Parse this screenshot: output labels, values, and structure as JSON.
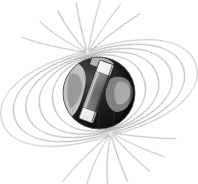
{
  "figure": {
    "title": "Earth's magnetic dipole field with internal bar magnet",
    "background_color": "#ffffff",
    "width": 198,
    "height": 184
  },
  "colors": {
    "background": "#ffffff",
    "field_line": "#9a9a9a",
    "field_line_faint": "#c2c2c2",
    "globe_dark": "#111111",
    "globe_mid": "#3a3a3a",
    "globe_land_light": "#d9d9d9",
    "globe_land_mid": "#8e8e8e",
    "globe_edge": "#555555",
    "magnet_light_pole": "#f2f2f2",
    "magnet_body": "#6e6e6e",
    "magnet_dark": "#2a2a2a",
    "magnet_outline": "#1a1a1a"
  },
  "globe": {
    "label": "earth-sphere",
    "center_x": 99,
    "center_y": 93,
    "radius": 36,
    "tilt_degrees": -18
  },
  "magnet": {
    "label": "bar-magnet",
    "center_x": 97,
    "center_y": 93,
    "length": 62,
    "width": 15,
    "rotation_degrees": 20,
    "north_end": "top-right",
    "south_end": "bottom-left"
  },
  "field": {
    "label": "magnetic-field-lines",
    "line_count": 26,
    "axis_tilt_degrees": -16,
    "north_pole_x": 101,
    "north_pole_y": 60,
    "south_pole_x": 96,
    "south_pole_y": 127,
    "loops": [
      {
        "side": "left",
        "extent": 14
      },
      {
        "side": "left",
        "extent": 26
      },
      {
        "side": "left",
        "extent": 40
      },
      {
        "side": "left",
        "extent": 56
      },
      {
        "side": "left",
        "extent": 74
      },
      {
        "side": "left",
        "extent": 92
      },
      {
        "side": "right",
        "extent": 14
      },
      {
        "side": "right",
        "extent": 26
      },
      {
        "side": "right",
        "extent": 40
      },
      {
        "side": "right",
        "extent": 56
      },
      {
        "side": "right",
        "extent": 74
      },
      {
        "side": "right",
        "extent": 92
      }
    ]
  }
}
